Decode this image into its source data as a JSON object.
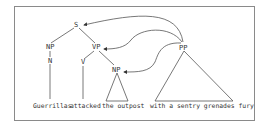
{
  "diagram": {
    "type": "syntax-tree",
    "nodes": {
      "s": "S",
      "np_subj": "NP",
      "vp": "VP",
      "n": "N",
      "v": "V",
      "np_obj": "NP",
      "pp": "PP"
    },
    "words": {
      "subject": "Guerrillas",
      "verb": "attacked",
      "object": "the outpost",
      "pp_phrase": "with a sentry grenades fury"
    },
    "arrows": [
      {
        "from": "PP",
        "to": "S"
      },
      {
        "from": "PP",
        "to": "VP"
      },
      {
        "from": "PP",
        "to": "NP"
      }
    ],
    "colors": {
      "line": "#555555",
      "text": "#333333",
      "frame": "#8a8a8a"
    }
  }
}
